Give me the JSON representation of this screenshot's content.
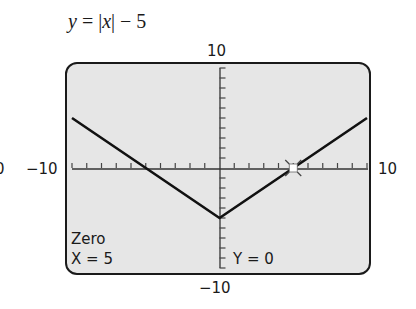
{
  "equation": {
    "lhs": "y",
    "eq": " = |",
    "var": "x",
    "rhs": "| − 5"
  },
  "window": {
    "ymax_label": "10",
    "ymin_label": "−10",
    "xmin_label": "−10",
    "xmax_label": "10",
    "clipped_left_label": "0"
  },
  "readout": {
    "mode": "Zero",
    "x_label": "X = 5",
    "y_label": "Y = 0"
  },
  "colors": {
    "screen_bg": "#e6e6e6",
    "ink": "#1a1a1a"
  },
  "chart_data": {
    "type": "line",
    "title": "y = |x| − 5",
    "xlabel": "",
    "ylabel": "",
    "xlim": [
      -10,
      10
    ],
    "ylim": [
      -10,
      10
    ],
    "xscl": 1,
    "yscl": 1,
    "grid": false,
    "series": [
      {
        "name": "y = |x| - 5",
        "x": [
          -10,
          -5,
          0,
          5,
          10
        ],
        "y": [
          5,
          0,
          -5,
          0,
          5
        ]
      }
    ],
    "annotations": [
      {
        "type": "cursor",
        "x": 5,
        "y": 0,
        "label": "Zero"
      }
    ],
    "tick_labels": {
      "top": "10",
      "bottom": "−10",
      "left": "−10",
      "right": "10"
    }
  }
}
